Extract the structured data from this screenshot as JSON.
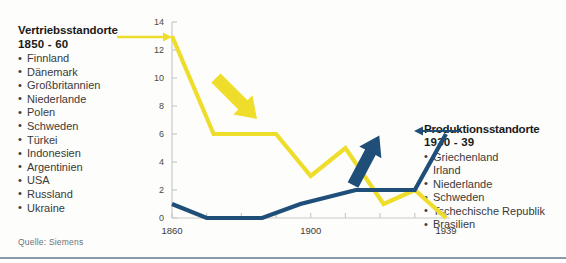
{
  "left_annotation": {
    "title": "Vertriebsstandorte",
    "period": "1850 - 60",
    "items": [
      "Finnland",
      "Dänemark",
      "Großbritannien",
      "Niederlande",
      "Polen",
      "Schweden",
      "Türkei",
      "Indonesien",
      "Argentinien",
      "USA",
      "Russland",
      "Ukraine"
    ],
    "arrow_color": "#efdd2c",
    "arrow_direction": "right"
  },
  "right_annotation": {
    "title": "Produktionsstandorte",
    "period": "1930 - 39",
    "items": [
      "Griechenland",
      "Irland",
      "Niederlande",
      "Schweden",
      "Tschechische Republik",
      "Brasilien"
    ],
    "arrow_color": "#1f4e79",
    "arrow_direction": "left"
  },
  "source": "Quelle: Siemens",
  "chart_data": {
    "type": "line",
    "title": "",
    "xlabel": "",
    "ylabel": "",
    "xlim": [
      1860,
      1939
    ],
    "ylim": [
      0,
      14
    ],
    "yticks": [
      0,
      2,
      4,
      6,
      8,
      10,
      12,
      14
    ],
    "xticks": [
      1860,
      1870,
      1880,
      1890,
      1900,
      1910,
      1920,
      1930,
      1939
    ],
    "xtick_labels_shown": [
      "1860",
      "1900",
      "1939"
    ],
    "grid": false,
    "legend": "none",
    "series": [
      {
        "name": "Vertriebsstandorte",
        "color": "#efdd2c",
        "x": [
          1860,
          1872,
          1890,
          1900,
          1910,
          1921,
          1930,
          1939
        ],
        "values": [
          13,
          6,
          6,
          3,
          5,
          1,
          2,
          0
        ]
      },
      {
        "name": "Produktionsstandorte",
        "color": "#1f4e79",
        "x": [
          1860,
          1870,
          1886,
          1897,
          1913,
          1930,
          1939
        ],
        "values": [
          1,
          0,
          0,
          1,
          2,
          2,
          6
        ]
      }
    ],
    "inline_arrows": [
      {
        "name": "decline-arrow",
        "color": "#efdd2c",
        "direction": "down-right"
      },
      {
        "name": "growth-arrow",
        "color": "#1f4e79",
        "direction": "up-right"
      }
    ]
  }
}
